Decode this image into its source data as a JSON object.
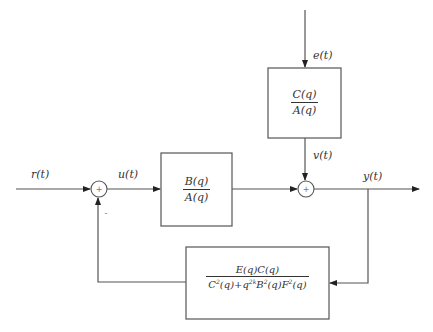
{
  "diagram": {
    "type": "closed-loop block diagram",
    "signals": {
      "reference": "r(t)",
      "control": "u(t)",
      "noise": "e(t)",
      "disturbance": "v(t)",
      "output": "y(t)"
    },
    "blocks": {
      "plant": {
        "numerator": "B(q)",
        "denominator": "A(q)"
      },
      "noise_filter": {
        "numerator": "C(q)",
        "denominator": "A(q)"
      },
      "feedback": {
        "numerator": "E(q)C(q)",
        "denominator": "C²(q)+q^{2k}B²(q)F²(q)"
      }
    },
    "summing_junctions": {
      "input_sum": {
        "symbol": "+",
        "feedback_sign": "-"
      },
      "output_sum": {
        "symbol": "+"
      }
    }
  }
}
